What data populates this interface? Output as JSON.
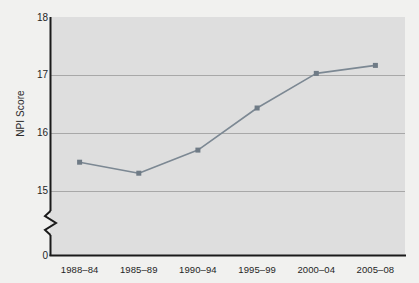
{
  "chart_data": {
    "type": "line",
    "title": "",
    "xlabel": "",
    "ylabel": "NPI Score",
    "categories": [
      "1988–84",
      "1985–89",
      "1990–94",
      "1995–99",
      "2000–04",
      "2005–08"
    ],
    "values": [
      15.49,
      15.3,
      15.7,
      16.43,
      17.03,
      17.17
    ],
    "series": [
      {
        "name": "NPI Score",
        "values": [
          15.49,
          15.3,
          15.7,
          16.43,
          17.03,
          17.17
        ]
      }
    ],
    "ylim": [
      15,
      18
    ],
    "yticks": [
      "0",
      "15",
      "16",
      "17",
      "18"
    ],
    "ytick_values": [
      0,
      15,
      16,
      17,
      18
    ],
    "axis_break": true,
    "axis_break_note": "zigzag break on y-axis between 0 and 15",
    "grid": true,
    "grid_axis": "y",
    "legend": "none",
    "marker": "square",
    "colors": {
      "line": "#7c8893",
      "marker": "#6f7b86",
      "plot_background": "#dedede",
      "grid": "#a8a8a8",
      "axis": "#1a1a1a",
      "page_background": "#f1f1ef",
      "text": "#1f1f1f"
    }
  }
}
